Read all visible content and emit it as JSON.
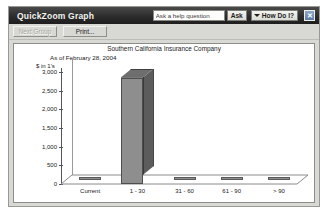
{
  "window": {
    "title": "QuickZoom Graph",
    "close_label": "✕"
  },
  "help": {
    "question_value": "Ask a help question",
    "question_placeholder": "Ask a help question",
    "ask_label": "Ask",
    "how_do_i_label": "How Do I?"
  },
  "toolbar": {
    "next_group_label": "Next Group",
    "print_label": "Print..."
  },
  "chart_data": {
    "type": "bar",
    "title": "Southern California Insurance Company",
    "subtitle": "As of February 28, 2004",
    "xlabel": "",
    "ylabel": "$ in 1's",
    "categories": [
      "Current",
      "1 - 30",
      "31 - 60",
      "61 - 90",
      "> 90"
    ],
    "values": [
      0,
      2850,
      0,
      0,
      0
    ],
    "ylim": [
      0,
      3000
    ],
    "ytick_labels": [
      "0",
      "500",
      "1,000",
      "1,500",
      "2,000",
      "2,500",
      "3,000"
    ],
    "ytick_values": [
      0,
      500,
      1000,
      1500,
      2000,
      2500,
      3000
    ],
    "grid": false,
    "legend": false,
    "bar_face_color": "#8e8e8e",
    "bar_side_color": "#5c5c5c",
    "bar_top_color": "#6e6e6e"
  }
}
